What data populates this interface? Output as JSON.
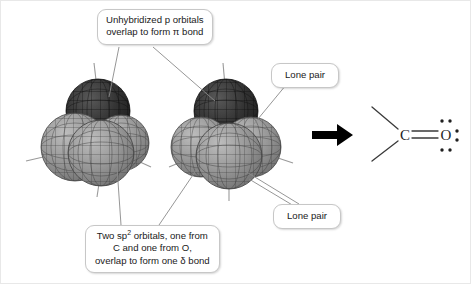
{
  "figure": {
    "background_color": "#ffffff"
  },
  "callouts": [
    {
      "id": "pi-bond",
      "name": "callout-unhybridized-p-orbitals",
      "line1": "Unhybridized p orbitals",
      "line2": "overlap to form π bond"
    },
    {
      "id": "sigma-bond",
      "name": "callout-sp2-orbitals",
      "line1_a": "Two sp",
      "line1_sup": "2",
      "line1_b": " orbitals, one from",
      "line2": "C and one from O,",
      "line3": "overlap to form one δ bond"
    },
    {
      "id": "lone-pair-top",
      "name": "callout-lone-pair-top",
      "label": "Lone pair"
    },
    {
      "id": "lone-pair-bottom",
      "name": "callout-lone-pair-bottom",
      "label": "Lone pair"
    }
  ],
  "orbital_models": [
    {
      "id": "carbon-cluster",
      "name": "carbon-orbital-cluster",
      "atom": "C",
      "p_lobe_color": "#2e2e2e",
      "sp2_lobe_color": "#8c8c8c",
      "mesh_color": "#3a3a3a"
    },
    {
      "id": "oxygen-cluster",
      "name": "oxygen-orbital-cluster",
      "atom": "O",
      "p_lobe_color": "#2e2e2e",
      "sp2_lobe_color": "#8c8c8c",
      "mesh_color": "#3a3a3a"
    }
  ],
  "arrow": {
    "name": "transformation-arrow",
    "direction": "right",
    "color": "#000000"
  },
  "lewis_structure": {
    "name": "lewis-structure-carbonyl",
    "carbon_label": "C",
    "oxygen_label": "O",
    "bond_type": "double",
    "oxygen_lone_pairs": 3,
    "substituent_bonds": 2,
    "line_color": "#3a3a3a",
    "dot_color": "#1f1f1f"
  },
  "colors": {
    "callout_border": "#c7c7c7",
    "callout_fill": "#ffffff",
    "leader_line": "#8a8a8a",
    "text": "#1a1a1a"
  }
}
